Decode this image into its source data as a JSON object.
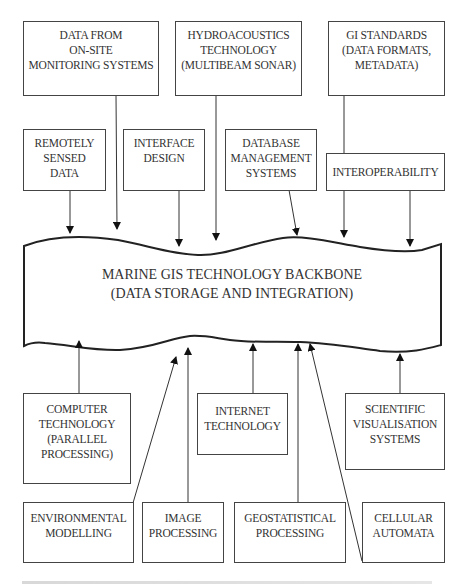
{
  "diagram": {
    "backbone": {
      "lines": [
        "MARINE GIS TECHNOLOGY BACKBONE",
        "(DATA STORAGE AND INTEGRATION)"
      ]
    },
    "top_row": [
      {
        "id": "on-site-monitoring",
        "lines": [
          "DATA FROM",
          "ON-SITE",
          "MONITORING SYSTEMS"
        ]
      },
      {
        "id": "hydroacoustics",
        "lines": [
          "HYDROACOUSTICS",
          "TECHNOLOGY",
          "(MULTIBEAM SONAR)"
        ]
      },
      {
        "id": "gi-standards",
        "lines": [
          "GI STANDARDS",
          "(DATA FORMATS,",
          "METADATA)"
        ]
      }
    ],
    "second_row": [
      {
        "id": "remotely-sensed-data",
        "lines": [
          "REMOTELY",
          "SENSED",
          "DATA"
        ]
      },
      {
        "id": "interface-design",
        "lines": [
          "INTERFACE",
          "DESIGN"
        ]
      },
      {
        "id": "database-management",
        "lines": [
          "DATABASE",
          "MANAGEMENT",
          "SYSTEMS"
        ]
      },
      {
        "id": "interoperability",
        "lines": [
          "INTEROPERABILITY"
        ]
      }
    ],
    "third_row": [
      {
        "id": "computer-technology",
        "lines": [
          "COMPUTER",
          "TECHNOLOGY",
          "(PARALLEL",
          "PROCESSING)"
        ]
      },
      {
        "id": "internet-technology",
        "lines": [
          "INTERNET",
          "TECHNOLOGY"
        ]
      },
      {
        "id": "scientific-visualisation",
        "lines": [
          "SCIENTIFIC",
          "VISUALISATION",
          "SYSTEMS"
        ]
      }
    ],
    "bottom_row": [
      {
        "id": "environmental-modelling",
        "lines": [
          "ENVIRONMENTAL",
          "MODELLING"
        ]
      },
      {
        "id": "image-processing",
        "lines": [
          "IMAGE",
          "PROCESSING"
        ]
      },
      {
        "id": "geostatistical-processing",
        "lines": [
          "GEOSTATISTICAL",
          "PROCESSING"
        ]
      },
      {
        "id": "cellular-automata",
        "lines": [
          "CELLULAR",
          "AUTOMATA"
        ]
      }
    ],
    "colors": {
      "stroke": "#333333",
      "text": "#333333",
      "background": "#ffffff"
    }
  }
}
